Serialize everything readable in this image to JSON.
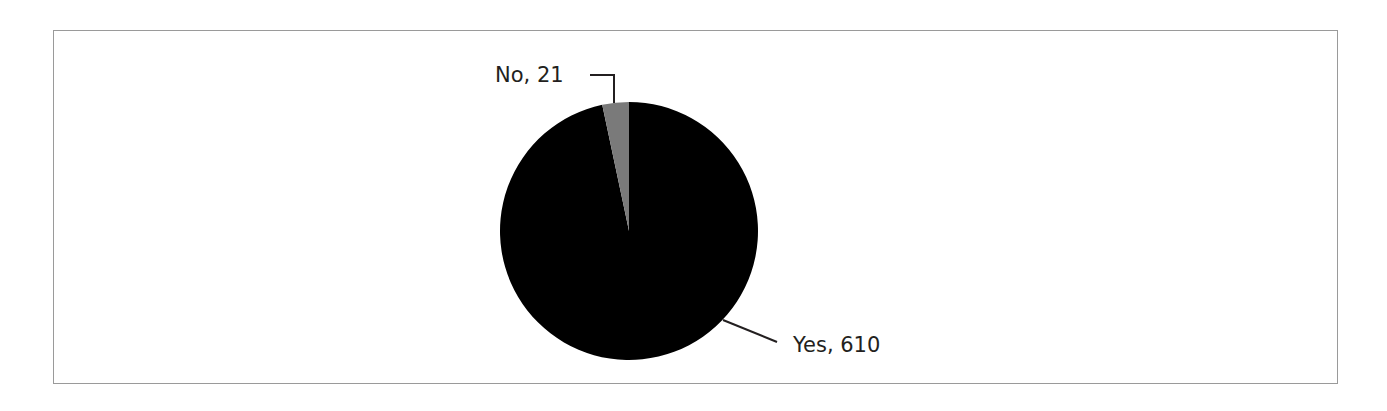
{
  "chart_data": {
    "type": "pie",
    "title": "",
    "categories": [
      "Yes",
      "No"
    ],
    "values": [
      610,
      21
    ],
    "labels": [
      "Yes, 610",
      "No, 21"
    ],
    "colors": {
      "Yes": "#000000",
      "No": "#7a7a7a"
    },
    "start_angle_deg": 90,
    "direction": "counterclockwise for No slice from 12 o'clock",
    "legend": "none (direct labels with leader lines)"
  },
  "labels": {
    "yes": "Yes, 610",
    "no": "No, 21"
  }
}
